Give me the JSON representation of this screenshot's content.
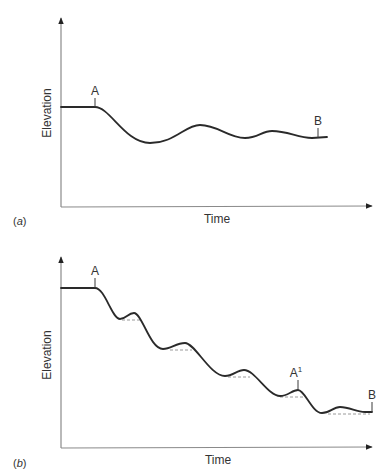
{
  "panels": [
    {
      "id": "a",
      "panel_label": "a",
      "x_axis_label": "Time",
      "y_axis_label": "Elevation",
      "point_labels": {
        "start": "A",
        "end": "B"
      },
      "description": "Damped oscillation of elevation between points A and B"
    },
    {
      "id": "b",
      "panel_label": "b",
      "x_axis_label": "Time",
      "y_axis_label": "Elevation",
      "point_labels": {
        "start": "A",
        "mid": "A",
        "mid_sup": "1",
        "end": "B"
      },
      "description": "Step-wise decline of elevation with small oscillations and dashed equilibrium levels"
    }
  ],
  "colors": {
    "curve": "#2a2a2a",
    "axis": "#8a8a8a",
    "dashed": "#9a9a9a",
    "text": "#333333"
  }
}
